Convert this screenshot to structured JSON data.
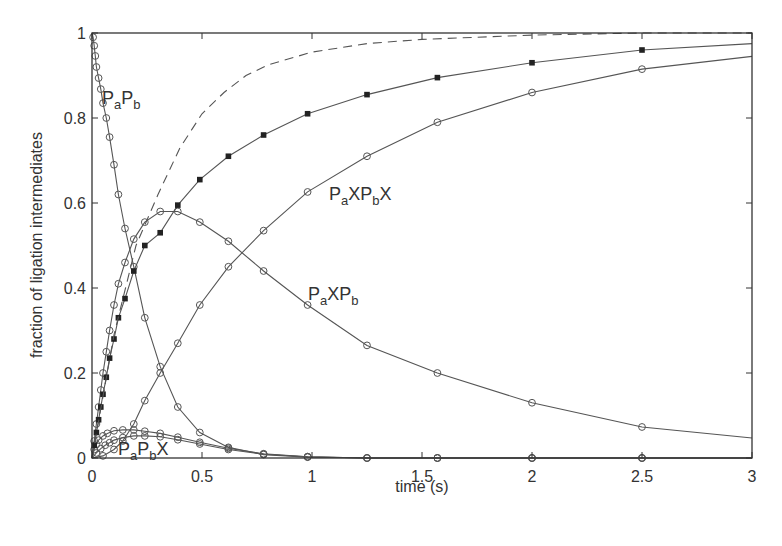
{
  "chart_data": {
    "type": "line",
    "title": "",
    "xlabel": "time (s)",
    "ylabel": "fraction of ligation intermediates",
    "xlim": [
      0,
      3
    ],
    "ylim": [
      0,
      1
    ],
    "xticks": [
      "0",
      "0.5",
      "1",
      "1.5",
      "2",
      "2.5",
      "3"
    ],
    "xtick_values": [
      0,
      0.5,
      1,
      1.5,
      2,
      2.5,
      3
    ],
    "yticks": [
      "0",
      "0.2",
      "0.4",
      "0.6",
      "0.8",
      "1"
    ],
    "ytick_values": [
      0,
      0.2,
      0.4,
      0.6,
      0.8,
      1
    ],
    "grid": false,
    "legend": "inline labels",
    "series": [
      {
        "name": "PaPb",
        "label_parts": [
          [
            "P",
            ""
          ],
          [
            "a",
            "sub"
          ],
          [
            "P",
            ""
          ],
          [
            "b",
            "sub"
          ]
        ],
        "marker": "open-circle",
        "line": "solid",
        "x": [
          0,
          0.005,
          0.01,
          0.015,
          0.02,
          0.03,
          0.04,
          0.05,
          0.065,
          0.08,
          0.1,
          0.12,
          0.15,
          0.19,
          0.24,
          0.31,
          0.39,
          0.49,
          0.62,
          0.78,
          0.98,
          1.25,
          1.57,
          2.0,
          2.5,
          3.0
        ],
        "y": [
          1.0,
          0.99,
          0.97,
          0.946,
          0.92,
          0.894,
          0.868,
          0.835,
          0.8,
          0.755,
          0.69,
          0.62,
          0.54,
          0.45,
          0.33,
          0.215,
          0.12,
          0.06,
          0.025,
          0.008,
          0.002,
          0.0,
          0.0,
          0.0,
          0.0,
          0.0
        ]
      },
      {
        "name": "PaPbX (one-sided, upper)",
        "label_parts": [
          [
            "P",
            ""
          ],
          [
            "a",
            "sub"
          ],
          [
            "P",
            ""
          ],
          [
            "b",
            "sub"
          ],
          [
            "X",
            ""
          ]
        ],
        "marker": "open-circle",
        "line": "solid",
        "x": [
          0,
          0.01,
          0.02,
          0.03,
          0.05,
          0.07,
          0.1,
          0.14,
          0.19,
          0.24,
          0.31,
          0.39,
          0.49,
          0.62,
          0.78,
          0.98,
          1.25,
          1.57,
          2.0,
          2.5,
          3.0
        ],
        "y": [
          0,
          0.02,
          0.032,
          0.042,
          0.052,
          0.058,
          0.064,
          0.066,
          0.066,
          0.063,
          0.058,
          0.049,
          0.037,
          0.023,
          0.01,
          0.003,
          0.0,
          0.0,
          0.0,
          0.0,
          0.0
        ]
      },
      {
        "name": "XPaPb (one-sided, lower)",
        "marker": "open-circle",
        "line": "solid",
        "x": [
          0,
          0.02,
          0.04,
          0.06,
          0.08,
          0.1,
          0.14,
          0.19,
          0.24,
          0.31,
          0.39,
          0.49,
          0.62,
          0.78,
          0.98,
          1.25,
          1.57,
          2.0,
          2.5,
          3.0
        ],
        "y": [
          0,
          0.012,
          0.022,
          0.03,
          0.036,
          0.042,
          0.048,
          0.052,
          0.052,
          0.05,
          0.043,
          0.033,
          0.02,
          0.009,
          0.003,
          0.0,
          0.0,
          0.0,
          0.0,
          0.0
        ]
      },
      {
        "name": "PaXPb",
        "label_parts": [
          [
            "P",
            ""
          ],
          [
            "a",
            "sub"
          ],
          [
            "X",
            ""
          ],
          [
            "P",
            ""
          ],
          [
            "b",
            "sub"
          ]
        ],
        "marker": "open-circle",
        "line": "solid",
        "x": [
          0,
          0.01,
          0.02,
          0.03,
          0.04,
          0.05,
          0.065,
          0.08,
          0.1,
          0.12,
          0.15,
          0.19,
          0.24,
          0.31,
          0.39,
          0.49,
          0.62,
          0.78,
          0.98,
          1.25,
          1.57,
          2.0,
          2.5,
          3.0
        ],
        "y": [
          0,
          0.04,
          0.08,
          0.12,
          0.16,
          0.2,
          0.25,
          0.3,
          0.36,
          0.41,
          0.46,
          0.515,
          0.555,
          0.58,
          0.58,
          0.555,
          0.51,
          0.44,
          0.36,
          0.265,
          0.2,
          0.13,
          0.073,
          0.047
        ]
      },
      {
        "name": "PaXPbX",
        "label_parts": [
          [
            "P",
            ""
          ],
          [
            "a",
            "sub"
          ],
          [
            "X",
            ""
          ],
          [
            "P",
            ""
          ],
          [
            "b",
            "sub"
          ],
          [
            "X",
            ""
          ]
        ],
        "marker": "open-circle",
        "line": "solid",
        "x": [
          0,
          0.05,
          0.1,
          0.14,
          0.19,
          0.24,
          0.31,
          0.39,
          0.49,
          0.62,
          0.78,
          0.98,
          1.25,
          1.57,
          2.0,
          2.5,
          3.0
        ],
        "y": [
          0,
          0.005,
          0.02,
          0.04,
          0.08,
          0.135,
          0.2,
          0.27,
          0.36,
          0.45,
          0.535,
          0.626,
          0.71,
          0.79,
          0.86,
          0.915,
          0.945
        ]
      },
      {
        "name": "total ligated (filled squares)",
        "marker": "filled-square",
        "line": "solid",
        "x": [
          0,
          0.01,
          0.02,
          0.03,
          0.04,
          0.05,
          0.065,
          0.08,
          0.1,
          0.12,
          0.15,
          0.19,
          0.24,
          0.31,
          0.39,
          0.49,
          0.62,
          0.78,
          0.98,
          1.25,
          1.57,
          2.0,
          2.5,
          3.0
        ],
        "y": [
          0,
          0.03,
          0.06,
          0.09,
          0.12,
          0.15,
          0.19,
          0.235,
          0.28,
          0.33,
          0.375,
          0.44,
          0.5,
          0.53,
          0.595,
          0.655,
          0.71,
          0.76,
          0.81,
          0.855,
          0.895,
          0.93,
          0.96,
          0.975
        ]
      },
      {
        "name": "model (dashed)",
        "marker": "none",
        "line": "dashed",
        "x": [
          0,
          0.1,
          0.2,
          0.3,
          0.4,
          0.5,
          0.6,
          0.7,
          0.8,
          1.0,
          1.25,
          1.5,
          2.0,
          2.5,
          3.0
        ],
        "y": [
          0,
          0.29,
          0.5,
          0.62,
          0.73,
          0.81,
          0.86,
          0.9,
          0.925,
          0.955,
          0.975,
          0.985,
          0.995,
          1.0,
          1.0
        ]
      }
    ],
    "annotations": [
      {
        "text": "PaPb",
        "x": 0.05,
        "y": 0.82
      },
      {
        "text": "PaXPbX",
        "x": 1.1,
        "y": 0.61
      },
      {
        "text": "PaXPb",
        "x": 1.0,
        "y": 0.36
      },
      {
        "text": "PaPbX",
        "x": 0.12,
        "y": 0.01
      }
    ]
  },
  "style": {
    "line_color": "#555555",
    "axis_color": "#333333",
    "marker_fill": "#222222",
    "background": "#ffffff"
  }
}
